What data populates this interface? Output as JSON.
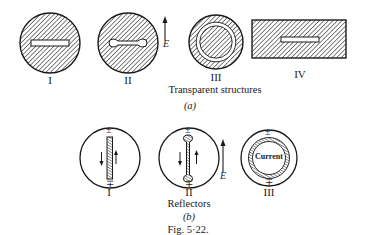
{
  "figure": {
    "number_label": "Fig. 5·22."
  },
  "part_a": {
    "caption": "Transparent structures",
    "sub_label": "(a)",
    "field_label": "E",
    "items": [
      {
        "label": "I",
        "shape": "circle-with-slot"
      },
      {
        "label": "II",
        "shape": "circle-with-dumbbell-slot"
      },
      {
        "label": "III",
        "shape": "circle-with-annular-slot"
      },
      {
        "label": "IV",
        "shape": "rectangle-with-slot"
      }
    ]
  },
  "part_b": {
    "caption": "Reflectors",
    "sub_label": "(b)",
    "field_label": "E",
    "items": [
      {
        "label": "I",
        "shape": "circle-with-strip",
        "charge_top": "±",
        "charge_bottom": "∓"
      },
      {
        "label": "II",
        "shape": "circle-with-dumbbell",
        "charge_top": "±",
        "charge_bottom": "∓"
      },
      {
        "label": "III",
        "shape": "circle-with-ring",
        "charge_top": "±",
        "charge_bottom": "∓",
        "ring_label": "Current"
      }
    ]
  },
  "colors": {
    "ink": "#1a1a1a",
    "paper": "#ffffff"
  }
}
